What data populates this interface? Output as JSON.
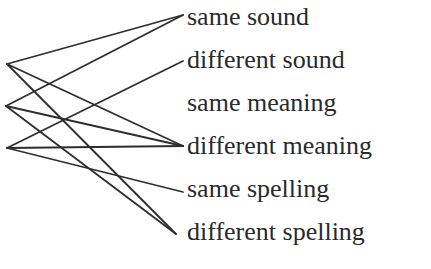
{
  "diagram": {
    "type": "bipartite-connection-diagram",
    "left_nodes": [
      {
        "id": "A",
        "x": 7,
        "y": 64
      },
      {
        "id": "B",
        "x": 6,
        "y": 106
      },
      {
        "id": "C",
        "x": 7,
        "y": 148
      }
    ],
    "right_labels": [
      {
        "id": "same_sound",
        "text": "same sound",
        "x": 187,
        "y": 25,
        "anchor_x": 183,
        "anchor_y": 15
      },
      {
        "id": "different_sound",
        "text": "different sound",
        "x": 187,
        "y": 68,
        "anchor_x": 183,
        "anchor_y": 61
      },
      {
        "id": "same_meaning",
        "text": "same meaning",
        "x": 187,
        "y": 111,
        "anchor_x": 183,
        "anchor_y": 103
      },
      {
        "id": "different_meaning",
        "text": "different meaning",
        "x": 187,
        "y": 154,
        "anchor_x": 183,
        "anchor_y": 146
      },
      {
        "id": "same_spelling",
        "text": "same spelling",
        "x": 187,
        "y": 197,
        "anchor_x": 183,
        "anchor_y": 192
      },
      {
        "id": "different_spelling",
        "text": "different spelling",
        "x": 187,
        "y": 240,
        "anchor_x": 176,
        "anchor_y": 234
      }
    ],
    "edges": [
      {
        "from": "A",
        "to": "same_sound"
      },
      {
        "from": "A",
        "to": "different_meaning"
      },
      {
        "from": "A",
        "to": "different_spelling"
      },
      {
        "from": "B",
        "to": "same_sound"
      },
      {
        "from": "B",
        "to": "different_meaning"
      },
      {
        "from": "B",
        "to": "different_spelling"
      },
      {
        "from": "C",
        "to": "different_sound"
      },
      {
        "from": "C",
        "to": "different_meaning"
      },
      {
        "from": "C",
        "to": "same_spelling"
      }
    ],
    "colors": {
      "line": "#2e2e2e",
      "text": "#2a2a2a",
      "background": "#ffffff"
    }
  }
}
